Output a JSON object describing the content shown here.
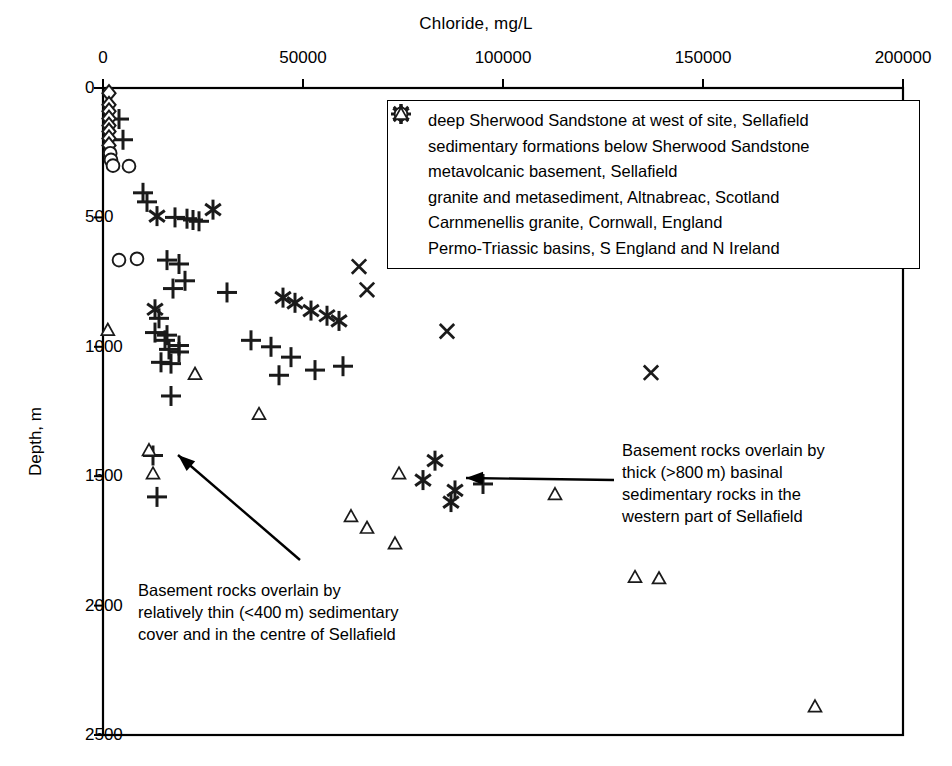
{
  "chart_data": {
    "type": "scatter",
    "title": "",
    "xlabel": "Chloride, mg/L",
    "ylabel": "Depth, m",
    "xlim": [
      0,
      200000
    ],
    "ylim": [
      0,
      2500
    ],
    "y_inverted": true,
    "grid": false,
    "xticks": [
      0,
      50000,
      100000,
      150000,
      200000
    ],
    "xtick_labels": [
      "0",
      "50000",
      "100000",
      "150000",
      "200000"
    ],
    "yticks": [
      0,
      500,
      1000,
      1500,
      2000,
      2500
    ],
    "ytick_labels": [
      "0",
      "500",
      "1000",
      "1500",
      "2000",
      "2500"
    ],
    "legend_position": "upper-center-right",
    "series": [
      {
        "name": "deep Sherwood Sandstone at west of site, Sellafield",
        "marker": "x",
        "marker_name": "cross-x-marker",
        "points": [
          [
            64000,
            690
          ],
          [
            66000,
            780
          ],
          [
            86000,
            940
          ],
          [
            137000,
            1100
          ]
        ]
      },
      {
        "name": "sedimentary formations below Sherwood Sandstone",
        "marker": "asterisk",
        "marker_name": "asterisk-marker",
        "points": [
          [
            13500,
            495
          ],
          [
            27500,
            470
          ],
          [
            13000,
            855
          ],
          [
            45000,
            810
          ],
          [
            48000,
            830
          ],
          [
            52000,
            860
          ],
          [
            56000,
            880
          ],
          [
            59000,
            900
          ],
          [
            83000,
            1440
          ],
          [
            80000,
            1515
          ],
          [
            88000,
            1555
          ],
          [
            87000,
            1600
          ]
        ]
      },
      {
        "name": "metavolcanic basement, Sellafield",
        "marker": "plus",
        "marker_name": "plus-marker",
        "points": [
          [
            4000,
            120
          ],
          [
            5000,
            200
          ],
          [
            10000,
            405
          ],
          [
            11000,
            440
          ],
          [
            18000,
            500
          ],
          [
            21000,
            505
          ],
          [
            22500,
            510
          ],
          [
            24000,
            515
          ],
          [
            16000,
            665
          ],
          [
            19000,
            680
          ],
          [
            20500,
            745
          ],
          [
            17500,
            775
          ],
          [
            31000,
            790
          ],
          [
            14000,
            890
          ],
          [
            13000,
            945
          ],
          [
            16000,
            955
          ],
          [
            15500,
            975
          ],
          [
            19000,
            995
          ],
          [
            37000,
            975
          ],
          [
            42000,
            1000
          ],
          [
            16500,
            1010
          ],
          [
            19000,
            1020
          ],
          [
            14500,
            1060
          ],
          [
            17000,
            1065
          ],
          [
            47000,
            1040
          ],
          [
            53000,
            1090
          ],
          [
            17000,
            1190
          ],
          [
            44000,
            1110
          ],
          [
            60000,
            1075
          ],
          [
            12500,
            1420
          ],
          [
            13500,
            1580
          ],
          [
            95000,
            1530
          ]
        ]
      },
      {
        "name": "granite and metasediment, Altnabreac, Scotland",
        "marker": "diamond",
        "marker_name": "diamond-marker",
        "points": [
          [
            1500,
            20
          ],
          [
            1500,
            65
          ],
          [
            1500,
            90
          ],
          [
            1500,
            118
          ],
          [
            1500,
            145
          ],
          [
            1500,
            168
          ],
          [
            1500,
            195
          ],
          [
            1500,
            222
          ]
        ]
      },
      {
        "name": "Carnmenellis granite, Cornwall, England",
        "marker": "circle",
        "marker_name": "circle-marker",
        "points": [
          [
            1800,
            252
          ],
          [
            2000,
            278
          ],
          [
            2500,
            300
          ],
          [
            6500,
            302
          ],
          [
            4000,
            665
          ],
          [
            8500,
            660
          ]
        ]
      },
      {
        "name": "Permo-Triassic basins, S England and N Ireland",
        "marker": "triangle",
        "marker_name": "triangle-marker",
        "points": [
          [
            1200,
            935
          ],
          [
            23000,
            1105
          ],
          [
            39000,
            1260
          ],
          [
            11500,
            1400
          ],
          [
            12500,
            1490
          ],
          [
            74000,
            1490
          ],
          [
            62000,
            1655
          ],
          [
            113000,
            1570
          ],
          [
            66000,
            1700
          ],
          [
            73000,
            1760
          ],
          [
            133000,
            1890
          ],
          [
            139000,
            1895
          ],
          [
            178000,
            2390
          ]
        ]
      }
    ]
  },
  "legend": {
    "items": [
      {
        "marker": "x",
        "label": "deep Sherwood Sandstone at west of site, Sellafield"
      },
      {
        "marker": "asterisk",
        "label": "sedimentary formations below Sherwood Sandstone"
      },
      {
        "marker": "plus",
        "label": "metavolcanic basement, Sellafield"
      },
      {
        "marker": "diamond",
        "label": "granite and metasediment, Altnabreac, Scotland"
      },
      {
        "marker": "circle",
        "label": "Carnmenellis granite, Cornwall, England"
      },
      {
        "marker": "triangle",
        "label": "Permo-Triassic basins, S England and N Ireland"
      }
    ]
  },
  "annotations": [
    {
      "name": "left-annotation",
      "text": "Basement rocks overlain by\nrelatively thin (<400 m) sedimentary\ncover and in the centre of Sellafield",
      "arrow_from": [
        300,
        560
      ],
      "arrow_to": [
        178,
        455
      ]
    },
    {
      "name": "right-annotation",
      "text": "Basement rocks overlain by\nthick (>800 m) basinal\nsedimentary rocks in the\nwestern part of Sellafield",
      "arrow_from": [
        614,
        480
      ],
      "arrow_to": [
        466,
        478
      ]
    }
  ],
  "colors": {
    "axis": "#000000",
    "marker": "#1a1a1a",
    "background": "#ffffff"
  }
}
